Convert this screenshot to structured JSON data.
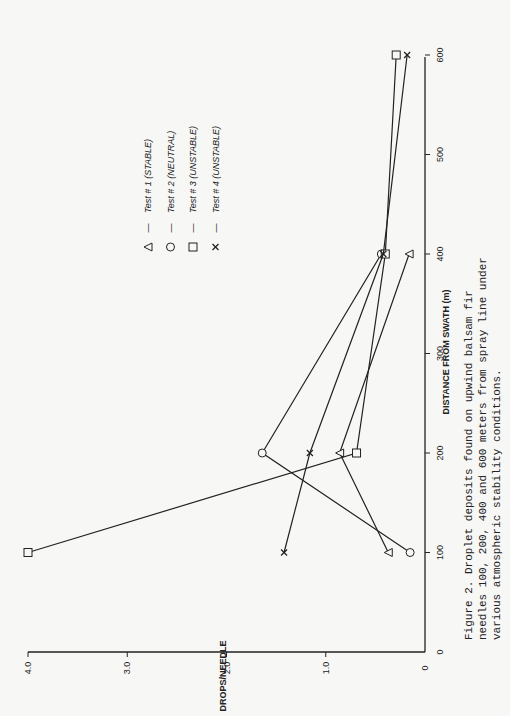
{
  "chart_data": {
    "type": "line",
    "title": "",
    "xlabel": "DISTANCE FROM SWATH (m)",
    "ylabel": "DROPS/NEEDLE",
    "xlim": [
      0,
      600
    ],
    "ylim": [
      0,
      4.0
    ],
    "x_ticks": [
      0,
      100,
      200,
      300,
      400,
      500,
      600
    ],
    "x_tick_labels": [
      "0",
      "100",
      "200",
      "300",
      "400",
      "500",
      "600"
    ],
    "y_ticks": [
      0,
      1.0,
      2.0,
      3.0,
      4.0
    ],
    "y_tick_labels": [
      "0",
      "1.0",
      "2.0",
      "3.0",
      "4.0"
    ],
    "grid": false,
    "orientation": "rotated 90° counterclockwise (page scanned sideways)",
    "legend_position": "upper-left of plot area (in rotated view)",
    "series": [
      {
        "name": "Test # 1 (STABLE)",
        "marker": "triangle",
        "x": [
          100,
          200,
          400
        ],
        "values": [
          0.37,
          0.86,
          0.16
        ]
      },
      {
        "name": "Test # 2 (NEUTRAL)",
        "marker": "circle",
        "x": [
          100,
          200,
          400
        ],
        "values": [
          0.15,
          1.64,
          0.44
        ]
      },
      {
        "name": "Test # 3 (UNSTABLE)",
        "marker": "square",
        "x": [
          100,
          200,
          400,
          600
        ],
        "values": [
          4.0,
          0.69,
          0.4,
          0.29
        ]
      },
      {
        "name": "Test # 4 (UNSTABLE)",
        "marker": "x",
        "x": [
          100,
          200,
          400,
          600
        ],
        "values": [
          1.42,
          1.16,
          0.42,
          0.18
        ]
      }
    ],
    "caption": "Figure 2. Droplet deposits found on upwind balsam fir needles 100, 200, 400 and 600 meters from spray line under various atmospheric stability conditions."
  },
  "legend": {
    "items": [
      {
        "marker": "triangle-icon",
        "dash": "—",
        "label": "Test # 1 (STABLE)"
      },
      {
        "marker": "circle-icon",
        "dash": "—",
        "label": "Test # 2 (NEUTRAL)"
      },
      {
        "marker": "square-icon",
        "dash": "—",
        "label": "Test # 3 (UNSTABLE)"
      },
      {
        "marker": "x-icon",
        "dash": "—",
        "label": "Test # 4 (UNSTABLE)"
      }
    ]
  },
  "caption": {
    "line1": "Figure 2.  Droplet deposits found on upwind balsam fir",
    "line2": "needles 100, 200, 400 and 600 meters from spray line under",
    "line3": "various atmospheric stability conditions."
  },
  "colors": {
    "ink": "#222222",
    "paper": "#f7f7f5"
  }
}
